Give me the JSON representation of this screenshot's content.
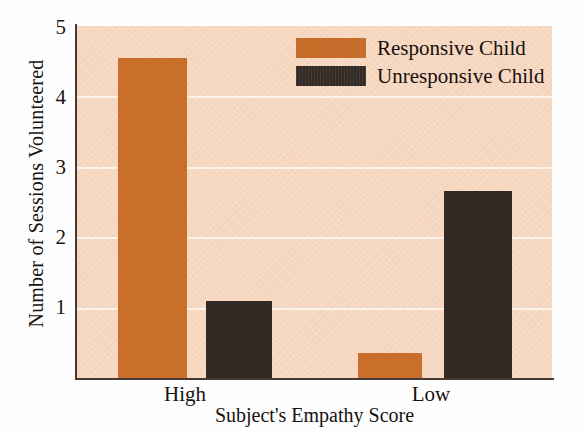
{
  "chart_data": {
    "type": "bar",
    "title": "",
    "xlabel": "Subject's Empathy Score",
    "ylabel": "Number of Sessions Volunteered",
    "categories": [
      "High",
      "Low"
    ],
    "series": [
      {
        "name": "Responsive Child",
        "color": "#c96f2b",
        "values": [
          4.55,
          0.35
        ]
      },
      {
        "name": "Unresponsive Child",
        "color": "#332a25",
        "values": [
          1.1,
          2.65
        ]
      }
    ],
    "ylim": [
      0,
      5
    ],
    "yticks": [
      1,
      2,
      3,
      4,
      5
    ],
    "ytick_labels": [
      "1",
      "2",
      "3",
      "4",
      "5"
    ],
    "grid": true,
    "grid_axis": "y",
    "legend_position": "top-right",
    "plot_background": "#f6d7c0",
    "figure_background": "#ffffff",
    "axis_color": "#473a33",
    "gridline_color": "#fdf2e8"
  },
  "legend": {
    "entries": [
      {
        "label": "Responsive Child",
        "swatch": "responsive"
      },
      {
        "label": "Unresponsive Child",
        "swatch": "unresponsive"
      }
    ]
  },
  "axes": {
    "x_title": "Subject's Empathy Score",
    "y_title": "Number of Sessions Volunteered",
    "x_tick_labels": [
      "High",
      "Low"
    ],
    "y_tick_labels": [
      "5",
      "4",
      "3",
      "2",
      "1"
    ]
  }
}
